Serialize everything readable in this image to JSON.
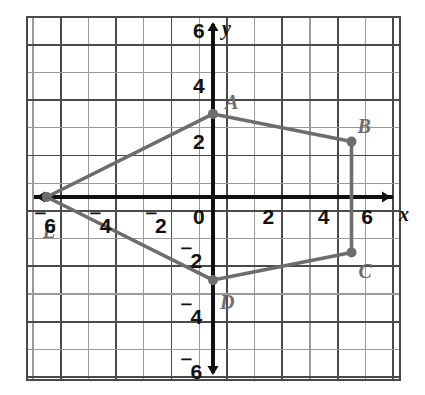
{
  "chart_data": {
    "type": "scatter",
    "title": "",
    "xlabel": "x",
    "ylabel": "y",
    "xlim": [
      -6.5,
      6.5
    ],
    "ylim": [
      -6.5,
      6.5
    ],
    "grid": true,
    "grid_step": 1,
    "legend": "none",
    "shape": "polygon",
    "closed": true,
    "points": [
      {
        "label": "A",
        "x": 0,
        "y": 3,
        "label_dx": 12,
        "label_dy": -22
      },
      {
        "label": "B",
        "x": 5,
        "y": 2,
        "label_dx": 6,
        "label_dy": -26
      },
      {
        "label": "C",
        "x": 5,
        "y": -2,
        "label_dx": 7,
        "label_dy": 9
      },
      {
        "label": "D",
        "x": 0,
        "y": -3,
        "label_dx": 7,
        "label_dy": 12
      },
      {
        "label": "E",
        "x": -6,
        "y": 0,
        "label_dx": -4,
        "label_dy": 24
      }
    ],
    "x_ticks": [
      {
        "value": -6,
        "text": "6",
        "negative": true
      },
      {
        "value": -4,
        "text": "4",
        "negative": true
      },
      {
        "value": -2,
        "text": "2",
        "negative": true
      },
      {
        "value": 0,
        "text": "0",
        "negative": false
      },
      {
        "value": 2,
        "text": "2",
        "negative": false
      },
      {
        "value": 4,
        "text": "4",
        "negative": false
      },
      {
        "value": 6,
        "text": "6",
        "negative": false
      }
    ],
    "y_ticks": [
      {
        "value": 6,
        "text": "6",
        "negative": false
      },
      {
        "value": 4,
        "text": "4",
        "negative": false
      },
      {
        "value": 2,
        "text": "2",
        "negative": false
      },
      {
        "value": -2,
        "text": "2",
        "negative": true
      },
      {
        "value": -4,
        "text": "4",
        "negative": true
      },
      {
        "value": -6,
        "text": "6",
        "negative": true
      }
    ],
    "colors": {
      "polygon_stroke": "#6d6d6d",
      "point_fill": "#6d6d6d",
      "axis": "#111111",
      "grid_major": "#4a4a4a",
      "grid_minor": "#9a9a9a",
      "label_text": "#111111",
      "point_label_text": "#6d6d6d",
      "background": "#ffffff"
    },
    "negative_sign_glyph": "⁻"
  },
  "geometry": {
    "origin_px_x": 213,
    "origin_px_y": 197,
    "unit_px": 27.7,
    "grid_left_px": 27,
    "grid_top_px": 17,
    "grid_right_px": 400,
    "grid_bottom_px": 380
  },
  "axis_labels": {
    "x_name": "x",
    "y_name": "y"
  }
}
